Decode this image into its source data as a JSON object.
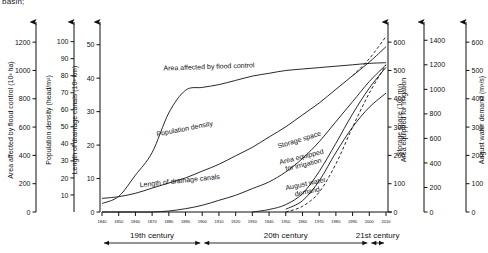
{
  "caption": "basin;",
  "chart_data": {
    "type": "line",
    "title": "",
    "subtitle": "",
    "xlabel": "",
    "grid": false,
    "legend_position": "inline-curve-labels",
    "x": [
      1840,
      1850,
      1860,
      1870,
      1880,
      1890,
      1900,
      1910,
      1920,
      1930,
      1940,
      1950,
      1960,
      1970,
      1980,
      1990,
      2000,
      2010
    ],
    "xlim": [
      1840,
      2010
    ],
    "xtick_labels": [
      "1840",
      "1850",
      "1860",
      "1870",
      "1880",
      "1890",
      "1900",
      "1910",
      "1920",
      "1930",
      "1940",
      "1950",
      "1960",
      "1970",
      "1980",
      "1990",
      "2000",
      "2010"
    ],
    "period_bands": [
      {
        "label": "19th century",
        "start": 1840,
        "end": 1900
      },
      {
        "label": "20th century",
        "start": 1900,
        "end": 2000
      },
      {
        "label": "21st century",
        "start": 2000,
        "end": 2010
      }
    ],
    "axes": [
      {
        "id": "flood",
        "label": "Area affected by flood control (10³ ha)",
        "side": "left",
        "ticks": [
          0,
          200,
          400,
          600,
          800,
          1000,
          1200
        ],
        "ylim": [
          0,
          1300
        ]
      },
      {
        "id": "population",
        "label": "Population density (head/m²)",
        "side": "left",
        "ticks": [
          10,
          20,
          30,
          40,
          50,
          60,
          70,
          80,
          90,
          100
        ],
        "ylim": [
          0,
          108
        ]
      },
      {
        "id": "canals",
        "label": "Length of drainage canals (10³ km)",
        "side": "left",
        "ticks": [
          0,
          10,
          20,
          30,
          40,
          50
        ],
        "ylim": [
          0,
          55
        ]
      },
      {
        "id": "irrigation",
        "label": "Area equipped for irrigation",
        "side": "right",
        "ticks": [
          0,
          100,
          200,
          300,
          400,
          500,
          600
        ],
        "ylim": [
          0,
          650
        ]
      },
      {
        "id": "storage",
        "label": "Storage space (10⁶ m³)",
        "side": "right",
        "ticks": [
          0,
          200,
          400,
          600,
          800,
          1000,
          1200,
          1400
        ],
        "ylim": [
          0,
          1500
        ]
      },
      {
        "id": "demand",
        "label": "August water demand (m³/s)",
        "side": "right",
        "ticks": [
          0,
          100,
          200,
          300,
          400,
          500,
          600
        ],
        "ylim": [
          0,
          650
        ]
      }
    ],
    "series": [
      {
        "name": "Area affected by flood control",
        "axis": "flood",
        "label_text": "Area affected by flood control",
        "style": "solid",
        "x": [
          1840,
          1850,
          1860,
          1870,
          1880,
          1890,
          1900,
          1910,
          1920,
          1930,
          1940,
          1950,
          1960,
          1970,
          1980,
          1990,
          2000,
          2010
        ],
        "values": [
          60,
          110,
          260,
          420,
          700,
          860,
          880,
          900,
          930,
          960,
          980,
          1000,
          1010,
          1020,
          1030,
          1040,
          1050,
          1055
        ]
      },
      {
        "name": "Population density",
        "axis": "population",
        "label_text": "Population density",
        "style": "solid",
        "x": [
          1840,
          1850,
          1860,
          1870,
          1880,
          1890,
          1900,
          1910,
          1920,
          1930,
          1940,
          1950,
          1960,
          1970,
          1980,
          1990,
          2000,
          2010
        ],
        "values": [
          8,
          9,
          11,
          14,
          17,
          20,
          24,
          28,
          33,
          38,
          44,
          50,
          57,
          64,
          72,
          80,
          88,
          97
        ]
      },
      {
        "name": "Population density projection",
        "axis": "population",
        "label_text": "",
        "style": "dashed",
        "x": [
          1990,
          2000,
          2010
        ],
        "values": [
          80,
          90,
          103
        ]
      },
      {
        "name": "Length of drainage canals",
        "axis": "canals",
        "label_text": "Length of drainage canals",
        "style": "solid",
        "x": [
          1840,
          1850,
          1860,
          1870,
          1880,
          1890,
          1900,
          1910,
          1920,
          1930,
          1940,
          1950,
          1960,
          1970,
          1980,
          1990,
          2000,
          2010
        ],
        "values": [
          0,
          0,
          0,
          0,
          0.3,
          1,
          2,
          3.5,
          5,
          7,
          9,
          12,
          16,
          21,
          27,
          33,
          39,
          44
        ]
      },
      {
        "name": "Storage space",
        "axis": "storage",
        "label_text": "Storage space",
        "style": "solid",
        "x": [
          1930,
          1940,
          1950,
          1960,
          1970,
          1980,
          1990,
          2000,
          2010
        ],
        "values": [
          0,
          20,
          60,
          150,
          330,
          560,
          800,
          1010,
          1180
        ]
      },
      {
        "name": "Area equipped for irrigation",
        "axis": "irrigation",
        "label_text": "Area equipped for irrigation",
        "style": "dashed",
        "x": [
          1950,
          1960,
          1970,
          1980,
          1990,
          2000,
          2010
        ],
        "values": [
          0,
          20,
          70,
          170,
          300,
          420,
          520
        ]
      },
      {
        "name": "August water demand",
        "axis": "demand",
        "label_text": "August water demand",
        "style": "solid",
        "x": [
          1950,
          1960,
          1970,
          1980,
          1990,
          2000,
          2010
        ],
        "values": [
          10,
          40,
          110,
          210,
          300,
          370,
          420
        ]
      }
    ]
  }
}
